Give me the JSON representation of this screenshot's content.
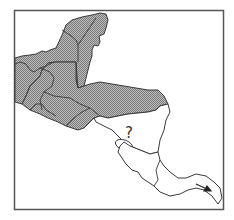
{
  "map": {
    "region": "Central America",
    "shaded_regions": [
      "Yucatan Peninsula",
      "Belize",
      "Guatemala",
      "El Salvador",
      "Honduras"
    ],
    "unshaded_regions": [
      "Nicaragua",
      "Costa Rica",
      "Panama"
    ],
    "annotation": "?",
    "colors": {
      "shaded_fill": "#a8a8a8",
      "outline": "#3a3a3a",
      "frame": "#555555",
      "background": "#ffffff"
    }
  }
}
